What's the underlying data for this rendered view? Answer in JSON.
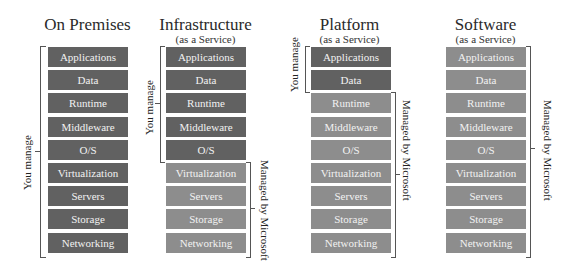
{
  "layers": [
    "Applications",
    "Data",
    "Runtime",
    "Middleware",
    "O/S",
    "Virtualization",
    "Servers",
    "Storage",
    "Networking"
  ],
  "columns": [
    {
      "title": "On Premises",
      "subtitle": "",
      "you_manage_count": 9,
      "you_label": "You manage",
      "ms_label": ""
    },
    {
      "title": "Infrastructure",
      "subtitle": "(as a Service)",
      "you_manage_count": 5,
      "you_label": "You manage",
      "ms_label": "Managed by Microsoft"
    },
    {
      "title": "Platform",
      "subtitle": "(as a Service)",
      "you_manage_count": 2,
      "you_label": "You manage",
      "ms_label": "Managed by Microsoft"
    },
    {
      "title": "Software",
      "subtitle": "(as a Service)",
      "you_manage_count": 0,
      "you_label": "",
      "ms_label": "Managed by Microsoft"
    }
  ],
  "colors": {
    "you_manage": "#616161",
    "managed_by_microsoft": "#8d8d8d"
  }
}
